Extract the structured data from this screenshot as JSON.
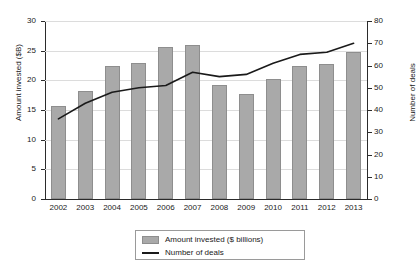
{
  "chart_data": {
    "type": "bar",
    "title": "",
    "subtitle": "",
    "xlabel": "",
    "ylabel": "Amount invested ($B)",
    "y2label": "Number of deals",
    "categories": [
      "2002",
      "2003",
      "2004",
      "2005",
      "2006",
      "2007",
      "2008",
      "2009",
      "2010",
      "2011",
      "2012",
      "2013"
    ],
    "ylim": [
      0,
      30
    ],
    "y2lim": [
      0,
      80
    ],
    "yticks": [
      0,
      5,
      10,
      15,
      20,
      25,
      30
    ],
    "y2ticks": [
      0,
      10,
      20,
      30,
      40,
      50,
      60,
      70,
      80
    ],
    "grid": true,
    "legend_position": "bottom",
    "series": [
      {
        "name": "Amount invested ($ billions)",
        "type": "bar",
        "axis": "left",
        "color": "#a9a9a9",
        "values": [
          15.6,
          18.2,
          22.4,
          23.0,
          25.6,
          26.0,
          19.3,
          17.7,
          20.2,
          22.4,
          22.8,
          24.7
        ]
      },
      {
        "name": "Number of deals",
        "type": "line",
        "axis": "right",
        "color": "#1a1a1a",
        "values": [
          36,
          43,
          48,
          50,
          51,
          57,
          55,
          56,
          61,
          65,
          66,
          70
        ]
      }
    ]
  },
  "axes": {
    "left": {
      "title": "Amount invested ($B)",
      "tick_labels": [
        "30",
        "25",
        "20",
        "15",
        "10",
        "5",
        "0"
      ]
    },
    "right": {
      "title": "Number of deals",
      "tick_labels": [
        "80",
        "70",
        "60",
        "50",
        "40",
        "30",
        "20",
        "10",
        "0"
      ]
    },
    "bottom": {
      "tick_labels": [
        "2002",
        "2003",
        "2004",
        "2005",
        "2006",
        "2007",
        "2008",
        "2009",
        "2010",
        "2011",
        "2012",
        "2013"
      ]
    }
  },
  "legend": {
    "items": [
      {
        "label": "Amount invested ($ billions)",
        "marker": "swatch",
        "color": "#a9a9a9"
      },
      {
        "label": "Number of deals",
        "marker": "line",
        "color": "#1a1a1a"
      }
    ]
  }
}
